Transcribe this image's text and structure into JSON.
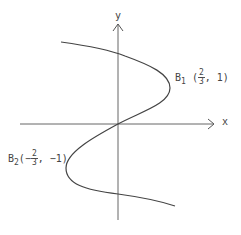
{
  "figure": {
    "axes": {
      "x_label": "x",
      "y_label": "y"
    },
    "points": [
      {
        "name": "B",
        "sub": "1",
        "open": "(",
        "sign": "",
        "num": "2",
        "den": "3",
        "rest": ", 1)"
      },
      {
        "name": "B",
        "sub": "2",
        "open": "(",
        "sign": "−",
        "num": "2",
        "den": "3",
        "rest": ", −1)"
      }
    ],
    "colors": {
      "curve": "#444444",
      "axis": "#666666"
    }
  }
}
